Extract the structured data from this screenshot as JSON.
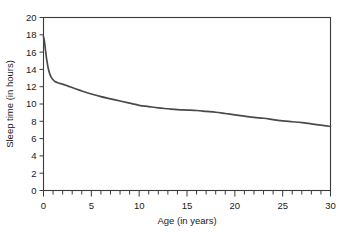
{
  "chart_data": {
    "type": "line",
    "title": "",
    "xlabel": "Age (in years)",
    "ylabel": "Sleep time (in hours)",
    "xlim": [
      0,
      30
    ],
    "ylim": [
      0,
      20
    ],
    "grid": false,
    "legend": null,
    "x_major_ticks": [
      0,
      5,
      10,
      15,
      20,
      25,
      30
    ],
    "x_minor_tick_interval": 1,
    "y_major_ticks": [
      0,
      2,
      4,
      6,
      8,
      10,
      12,
      14,
      16,
      18,
      20
    ],
    "x_tick_labels": [
      "0",
      "5",
      "10",
      "15",
      "20",
      "25",
      "30"
    ],
    "y_tick_labels": [
      "0",
      "2",
      "4",
      "6",
      "8",
      "10",
      "12",
      "14",
      "16",
      "18",
      "20"
    ],
    "line_color": "#4a4a4a",
    "frame_color": "#3a3a3a",
    "series": [
      {
        "name": "Sleep time",
        "x": [
          0,
          0.1,
          0.2,
          0.3,
          0.4,
          0.5,
          0.65,
          0.8,
          1.0,
          1.2,
          1.5,
          1.8,
          2.0,
          2.5,
          3.0,
          3.5,
          4.0,
          5.0,
          6.0,
          7.0,
          8.0,
          9.0,
          10.0,
          11.0,
          12.0,
          13.0,
          14.0,
          15.0,
          16.0,
          17.0,
          18.0,
          19.0,
          20.0,
          21.0,
          22.0,
          23.0,
          24.0,
          25.0,
          26.0,
          27.0,
          28.0,
          29.0,
          30.0
        ],
        "y": [
          17.8,
          17.2,
          16.3,
          15.4,
          14.7,
          14.1,
          13.5,
          13.1,
          12.8,
          12.6,
          12.45,
          12.35,
          12.3,
          12.1,
          11.9,
          11.7,
          11.5,
          11.15,
          10.85,
          10.6,
          10.35,
          10.1,
          9.85,
          9.7,
          9.55,
          9.45,
          9.35,
          9.3,
          9.25,
          9.15,
          9.05,
          8.9,
          8.75,
          8.6,
          8.45,
          8.35,
          8.2,
          8.05,
          7.95,
          7.85,
          7.7,
          7.55,
          7.4
        ]
      }
    ]
  },
  "axes": {
    "xlabel": "Age (in years)",
    "ylabel": "Sleep time (in hours)"
  }
}
